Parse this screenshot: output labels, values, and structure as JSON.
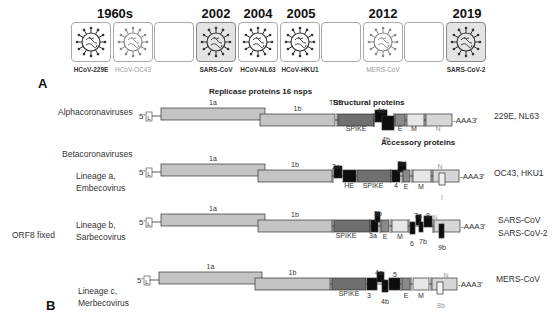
{
  "panel_a": {
    "label": "A",
    "eras": [
      {
        "year": "1960s",
        "x": 115
      },
      {
        "year": "2002",
        "x": 216
      },
      {
        "year": "2004",
        "x": 258
      },
      {
        "year": "2005",
        "x": 301
      },
      {
        "year": "2012",
        "x": 383
      },
      {
        "year": "2019",
        "x": 467
      }
    ],
    "tiles": [
      {
        "x": 71,
        "virus": "HCoV-229E",
        "icon": "virus-icon",
        "shaded": false,
        "faint": false
      },
      {
        "x": 113,
        "virus": "HCoV-OC43",
        "icon": "virus-icon",
        "shaded": false,
        "faint": true
      },
      {
        "x": 154,
        "virus": "",
        "icon": "",
        "shaded": false,
        "faint": false
      },
      {
        "x": 196,
        "virus": "SARS-CoV",
        "icon": "virus-icon",
        "shaded": true,
        "faint": false
      },
      {
        "x": 238,
        "virus": "HCoV-NL63",
        "icon": "virus-icon",
        "shaded": false,
        "faint": false
      },
      {
        "x": 280,
        "virus": "HCoV-HKU1",
        "icon": "virus-icon",
        "shaded": false,
        "faint": false
      },
      {
        "x": 321,
        "virus": "",
        "icon": "",
        "shaded": false,
        "faint": false
      },
      {
        "x": 363,
        "virus": "MERS-CoV",
        "icon": "virus-icon",
        "shaded": false,
        "faint": true
      },
      {
        "x": 404,
        "virus": "",
        "icon": "",
        "shaded": false,
        "faint": false
      },
      {
        "x": 446,
        "virus": "SARS-CoV-2",
        "icon": "virus-icon",
        "shaded": true,
        "faint": false
      }
    ]
  },
  "panel_b": {
    "label": "B",
    "replicase_header": "Replicase proteins  16 nsps",
    "structural_header": "Structural proteins",
    "accessory_header": "Accessory proteins",
    "trs_label": "TRS",
    "five_prime": "5'",
    "leader": "L",
    "three_prime": "-AAA3'",
    "orf8_note": "ORF8 fixed",
    "groups": {
      "alpha": "Alphacoronaviruses",
      "beta": "Betacoronaviruses"
    },
    "genomes": [
      {
        "id": "alpha",
        "lineage": "",
        "species": "229E, NL63",
        "y": 116,
        "orf1a_label": "1a",
        "orf1b_label": "1b",
        "genes": [
          {
            "label": "SPIKE",
            "type": "spike"
          },
          {
            "label": "4a",
            "type": "accessory"
          },
          {
            "label": "4b",
            "type": "accessory"
          },
          {
            "label": "E",
            "type": "structural"
          },
          {
            "label": "M",
            "type": "structural"
          },
          {
            "label": "N",
            "type": "structural"
          }
        ]
      },
      {
        "id": "lineage-a",
        "lineage": "Lineage a, Embecovirus",
        "species": "OC43, HKU1",
        "y": 172,
        "orf1a_label": "1a",
        "orf1b_label": "1b",
        "genes": [
          {
            "label": "2a",
            "type": "accessory"
          },
          {
            "label": "HE",
            "type": "accessory"
          },
          {
            "label": "SPIKE",
            "type": "spike"
          },
          {
            "label": "4",
            "type": "accessory"
          },
          {
            "label": "5a",
            "type": "accessory"
          },
          {
            "label": "E",
            "type": "structural"
          },
          {
            "label": "M",
            "type": "structural"
          },
          {
            "label": "N",
            "type": "structural"
          },
          {
            "label": "I",
            "type": "internal"
          }
        ]
      },
      {
        "id": "lineage-b",
        "lineage": "Lineage b, Sarbecovirus",
        "species": "SARS-CoV SARS-CoV-2",
        "y": 222,
        "orf1a_label": "1a",
        "orf1b_label": "1b",
        "genes": [
          {
            "label": "SPIKE",
            "type": "spike"
          },
          {
            "label": "3a",
            "type": "accessory"
          },
          {
            "label": "3b",
            "type": "accessory"
          },
          {
            "label": "E",
            "type": "structural"
          },
          {
            "label": "M",
            "type": "structural"
          },
          {
            "label": "6",
            "type": "accessory"
          },
          {
            "label": "7a",
            "type": "accessory"
          },
          {
            "label": "7b",
            "type": "accessory"
          },
          {
            "label": "8",
            "type": "accessory"
          },
          {
            "label": "N",
            "type": "structural"
          },
          {
            "label": "9b",
            "type": "accessory"
          }
        ]
      },
      {
        "id": "lineage-c",
        "lineage": "Lineage c, Merbecovirus",
        "species": "MERS-CoV",
        "y": 280,
        "orf1a_label": "1a",
        "orf1b_label": "1b",
        "genes": [
          {
            "label": "SPIKE",
            "type": "spike"
          },
          {
            "label": "3",
            "type": "accessory"
          },
          {
            "label": "4a",
            "type": "accessory"
          },
          {
            "label": "4b",
            "type": "accessory"
          },
          {
            "label": "5",
            "type": "accessory"
          },
          {
            "label": "E",
            "type": "structural"
          },
          {
            "label": "M",
            "type": "structural"
          },
          {
            "label": "N",
            "type": "structural"
          },
          {
            "label": "8b",
            "type": "internal"
          }
        ]
      }
    ]
  },
  "colors": {
    "orf1": "#c4c4c4",
    "spike": "#6f6f6f",
    "accessory": "#0d0d0d",
    "envelope": "#8a8a8a",
    "membrane": "#e6e6e6",
    "nucleocapsid": "#d6d6d6",
    "outline": "#333333"
  }
}
